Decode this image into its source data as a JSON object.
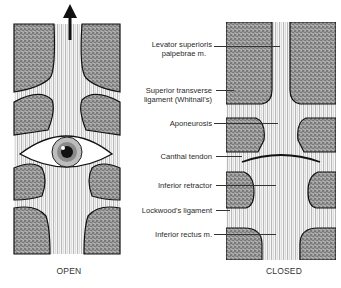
{
  "figure": {
    "panels": [
      {
        "id": "open",
        "caption": "OPEN"
      },
      {
        "id": "closed",
        "caption": "CLOSED"
      }
    ],
    "labels": [
      {
        "id": "levator",
        "line1": "Levator superioris",
        "line2": "palpebrae m."
      },
      {
        "id": "whitnall",
        "line1": "Superior transverse",
        "line2": "ligament (Whitnall's)"
      },
      {
        "id": "aponeurosis",
        "line1": "Aponeurosis"
      },
      {
        "id": "canthal",
        "line1": "Canthal tendon"
      },
      {
        "id": "inf-retractor",
        "line1": "Inferior retractor"
      },
      {
        "id": "lockwood",
        "line1": "Lockwood's ligament"
      },
      {
        "id": "inf-rectus",
        "line1": "Inferior rectus m."
      }
    ],
    "colors": {
      "stipple": "#8a8a8a",
      "stipple_dark": "#555555",
      "outline": "#111111",
      "fiber": "#6a6a6a",
      "text": "#2a2a2a"
    }
  }
}
